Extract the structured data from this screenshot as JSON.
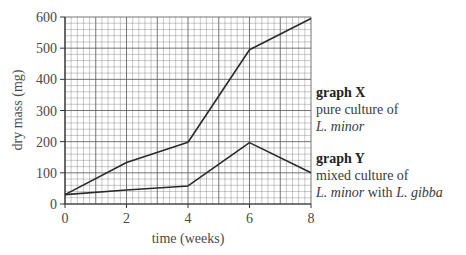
{
  "chart_data": {
    "type": "line",
    "title": "",
    "xlabel": "time (weeks)",
    "ylabel": "dry mass (mg)",
    "xlim": [
      0,
      8
    ],
    "ylim": [
      0,
      600
    ],
    "x_ticks": [
      0,
      2,
      4,
      6,
      8
    ],
    "y_ticks": [
      0,
      100,
      200,
      300,
      400,
      500,
      600
    ],
    "grid": true,
    "x": [
      0,
      2,
      4,
      6,
      8
    ],
    "series": [
      {
        "name": "graph X",
        "description": "pure culture of L. minor",
        "values": [
          30,
          133,
          198,
          495,
          595
        ]
      },
      {
        "name": "graph Y",
        "description": "mixed culture of L. minor with L. gibba",
        "values": [
          30,
          45,
          58,
          197,
          100
        ]
      }
    ],
    "legend_position": "right"
  },
  "labels": {
    "graph_x_title": "graph X",
    "graph_x_line1": "pure culture of",
    "graph_x_line2_italic": "L. minor",
    "graph_y_title": "graph Y",
    "graph_y_line1": "mixed culture of",
    "graph_y_line2_italic_a": "L. minor",
    "graph_y_line2_mid": " with ",
    "graph_y_line2_italic_b": "L. gibba"
  },
  "style": {
    "line_color": "#2a2a2a",
    "grid_color": "#555555"
  }
}
